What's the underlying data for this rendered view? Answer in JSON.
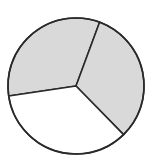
{
  "diagram": {
    "type": "circle-divided-into-sectors",
    "center": [
      76,
      86
    ],
    "radius": 68,
    "stroke_color": "#2a2a2a",
    "stroke_width": 1.6,
    "sectors": [
      {
        "name": "top-left",
        "start_deg": 171.5,
        "end_deg": 290.3,
        "fill": "#d9d9d9",
        "shaded": true
      },
      {
        "name": "right",
        "start_deg": -69.7,
        "end_deg": 45.6,
        "fill": "#d9d9d9",
        "shaded": true
      },
      {
        "name": "bottom",
        "start_deg": 45.6,
        "end_deg": 171.5,
        "fill": "#ffffff",
        "shaded": false
      }
    ],
    "shaded_count": 2,
    "total_count": 3
  }
}
